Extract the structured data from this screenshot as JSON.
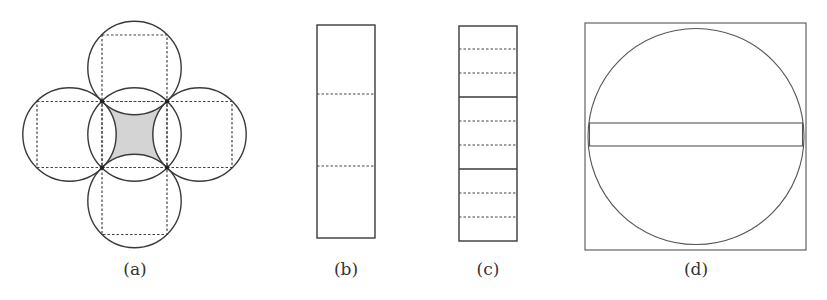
{
  "figure": {
    "panels": [
      {
        "id": "a",
        "label": "(a)",
        "description": "Five circles arranged in a plus shape, each circumscribing a dashed square; central region between four outer circles is shaded gray",
        "shade_color": "#d4d4d4"
      },
      {
        "id": "b",
        "label": "(b)",
        "description": "Tall rectangle divided into three parts by two dashed lines"
      },
      {
        "id": "c",
        "label": "(c)",
        "description": "Tall rectangle divided into three parts by solid lines, each part subdivided into three by dashed lines"
      },
      {
        "id": "d",
        "label": "(d)",
        "description": "Square with an inscribed circle and a thin horizontal rectangular band across the circle's diameter"
      }
    ]
  }
}
